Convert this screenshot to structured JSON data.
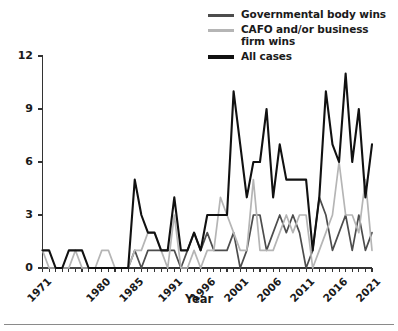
{
  "figure": {
    "background": "#ffffff",
    "bottom_rule_color": "#8a8a8a"
  },
  "legend": {
    "position": "top-right",
    "items": [
      {
        "label": "Governmental body wins",
        "color": "#4d4d4d",
        "width": 3
      },
      {
        "label": "CAFO and/or business firm wins",
        "color": "#b5b5b5",
        "width": 3
      },
      {
        "label": "All cases",
        "color": "#111111",
        "width": 4
      }
    ]
  },
  "axes": {
    "x_title": "Year",
    "y_title": "",
    "y_ticks": [
      "0",
      "3",
      "6",
      "9",
      "12"
    ],
    "x_ticks": [
      "1971",
      "1980",
      "1985",
      "1991",
      "1996",
      "2001",
      "2006",
      "2011",
      "2016",
      "2021"
    ],
    "axis_color": "#333333"
  },
  "chart_data": {
    "type": "line",
    "title": "",
    "subtitle": "",
    "xlabel": "Year",
    "ylabel": "",
    "xlim": [
      1971,
      2021
    ],
    "ylim": [
      0,
      12
    ],
    "grid": false,
    "legend_position": "top-right",
    "x": [
      1971,
      1972,
      1973,
      1974,
      1975,
      1976,
      1977,
      1978,
      1979,
      1980,
      1981,
      1982,
      1983,
      1984,
      1985,
      1986,
      1987,
      1988,
      1989,
      1990,
      1991,
      1992,
      1993,
      1994,
      1995,
      1996,
      1997,
      1998,
      1999,
      2000,
      2001,
      2002,
      2003,
      2004,
      2005,
      2006,
      2007,
      2008,
      2009,
      2010,
      2011,
      2012,
      2013,
      2014,
      2015,
      2016,
      2017,
      2018,
      2019,
      2020,
      2021
    ],
    "series": [
      {
        "name": "All cases",
        "color": "#111111",
        "values": [
          1,
          1,
          0,
          0,
          1,
          1,
          1,
          0,
          0,
          0,
          0,
          0,
          0,
          0,
          5,
          3,
          2,
          2,
          1,
          1,
          4,
          1,
          1,
          2,
          1,
          3,
          3,
          3,
          3,
          10,
          7,
          4,
          6,
          6,
          9,
          4,
          7,
          5,
          5,
          5,
          5,
          1,
          4,
          10,
          7,
          6,
          11,
          6,
          9,
          4,
          7
        ]
      },
      {
        "name": "Governmental body wins",
        "color": "#4d4d4d",
        "values": [
          0,
          0,
          0,
          0,
          0,
          0,
          0,
          0,
          0,
          0,
          0,
          0,
          0,
          0,
          1,
          0,
          1,
          1,
          1,
          1,
          1,
          0,
          1,
          2,
          1,
          2,
          1,
          1,
          1,
          2,
          0,
          1,
          3,
          3,
          1,
          2,
          3,
          2,
          3,
          2,
          0,
          1,
          4,
          3,
          1,
          2,
          3,
          1,
          3,
          1,
          2
        ]
      },
      {
        "name": "CAFO and/or business firm wins",
        "color": "#b5b5b5",
        "values": [
          1,
          0,
          0,
          0,
          0,
          1,
          0,
          0,
          0,
          1,
          1,
          0,
          0,
          0,
          1,
          1,
          2,
          2,
          1,
          0,
          3,
          0,
          0,
          1,
          0,
          1,
          1,
          4,
          3,
          2,
          1,
          1,
          5,
          1,
          1,
          1,
          2,
          3,
          2,
          3,
          3,
          0,
          1,
          2,
          3,
          6,
          3,
          3,
          2,
          5,
          1
        ]
      }
    ]
  }
}
